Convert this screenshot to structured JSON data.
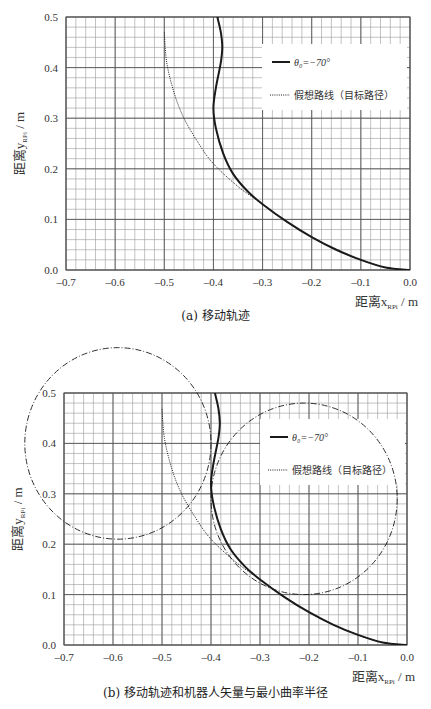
{
  "chart_data": [
    {
      "type": "line",
      "title": "(a) 移动轨迹",
      "xlabel": "距离x_RPi / m",
      "ylabel": "距离y_RPi / m",
      "xlim": [
        -0.7,
        0.0
      ],
      "ylim": [
        0.0,
        0.5
      ],
      "x_ticks": [
        "-0.7",
        "-0.6",
        "-0.5",
        "-0.4",
        "-0.3",
        "-0.2",
        "-0.1",
        "0.0"
      ],
      "y_ticks": [
        "0.0",
        "0.1",
        "0.2",
        "0.3",
        "0.4",
        "0.5"
      ],
      "grid": {
        "major": true,
        "minor": true,
        "minor_step": 0.02
      },
      "legend_position": "upper right",
      "series": [
        {
          "name": "θ0 = −70°",
          "style": "solid",
          "x": [
            0.0,
            -0.05,
            -0.1,
            -0.15,
            -0.2,
            -0.25,
            -0.3,
            -0.33,
            -0.36,
            -0.38,
            -0.395,
            -0.4,
            -0.395,
            -0.385,
            -0.382,
            -0.385,
            -0.392
          ],
          "y": [
            0.0,
            0.005,
            0.02,
            0.04,
            0.065,
            0.095,
            0.13,
            0.155,
            0.19,
            0.23,
            0.28,
            0.32,
            0.36,
            0.41,
            0.44,
            0.47,
            0.5
          ]
        },
        {
          "name": "假想路线（目标路径）",
          "style": "dotted",
          "x": [
            0.0,
            -0.05,
            -0.1,
            -0.15,
            -0.2,
            -0.25,
            -0.3,
            -0.35,
            -0.4,
            -0.43,
            -0.46,
            -0.48,
            -0.495,
            -0.5
          ],
          "y": [
            0.0,
            0.005,
            0.02,
            0.04,
            0.065,
            0.095,
            0.13,
            0.165,
            0.21,
            0.25,
            0.3,
            0.35,
            0.41,
            0.47
          ]
        }
      ]
    },
    {
      "type": "line",
      "title": "(b) 移动轨迹和机器人矢量与最小曲率半径",
      "xlabel": "距离x_RPi / m",
      "ylabel": "距离y_RPi / m",
      "xlim": [
        -0.7,
        0.0
      ],
      "ylim": [
        0.0,
        0.5
      ],
      "x_ticks": [
        "-0.7",
        "-0.6",
        "-0.5",
        "-0.4",
        "-0.3",
        "-0.2",
        "-0.1",
        "0.0"
      ],
      "y_ticks": [
        "0.0",
        "0.1",
        "0.2",
        "0.3",
        "0.4",
        "0.5"
      ],
      "grid": {
        "major": true,
        "minor": true,
        "minor_step": 0.02
      },
      "legend_position": "upper right",
      "series": [
        {
          "name": "θ0 = −70°",
          "style": "solid",
          "x": [
            0.0,
            -0.05,
            -0.1,
            -0.15,
            -0.2,
            -0.25,
            -0.3,
            -0.33,
            -0.36,
            -0.38,
            -0.395,
            -0.4,
            -0.395,
            -0.385,
            -0.382,
            -0.385,
            -0.392
          ],
          "y": [
            0.0,
            0.005,
            0.02,
            0.04,
            0.065,
            0.095,
            0.13,
            0.155,
            0.19,
            0.23,
            0.28,
            0.32,
            0.36,
            0.41,
            0.44,
            0.47,
            0.5
          ]
        },
        {
          "name": "假想路线（目标路径）",
          "style": "dotted",
          "x": [
            0.0,
            -0.05,
            -0.1,
            -0.15,
            -0.2,
            -0.25,
            -0.3,
            -0.35,
            -0.4,
            -0.43,
            -0.46,
            -0.48,
            -0.495,
            -0.5
          ],
          "y": [
            0.0,
            0.005,
            0.02,
            0.04,
            0.065,
            0.095,
            0.13,
            0.165,
            0.21,
            0.25,
            0.3,
            0.35,
            0.41,
            0.47
          ]
        },
        {
          "name": "minimum curvature radius circle (left)",
          "style": "dash-dot",
          "shape": "circle",
          "center": [
            -0.59,
            0.4
          ],
          "radius": 0.19
        },
        {
          "name": "minimum curvature radius circle (right)",
          "style": "dash-dot",
          "shape": "circle",
          "center": [
            -0.21,
            0.29
          ],
          "radius": 0.19
        }
      ]
    }
  ],
  "figure_a": {
    "caption": "(a) 移动轨迹",
    "legend": {
      "solid": "θ₀=−70°",
      "dotted": "假想路线（目标路径）"
    },
    "xlabel_main": "距离x",
    "xlabel_sub": "RPi",
    "xlabel_unit": " / m",
    "ylabel_main": "距离y",
    "ylabel_sub": "RPi",
    "ylabel_unit": " / m"
  },
  "figure_b": {
    "caption": "(b) 移动轨迹和机器人矢量与最小曲率半径",
    "legend": {
      "solid": "θ₀=−70°",
      "dotted": "假想路线（目标路径）"
    },
    "xlabel_main": "距离x",
    "xlabel_sub": "RPi",
    "xlabel_unit": " / m",
    "ylabel_main": "距离y",
    "ylabel_sub": "RPi",
    "ylabel_unit": " / m"
  },
  "colors": {
    "line": "#1a1a1a",
    "grid_major": "#555555",
    "grid_minor": "#9a9a9a",
    "text": "#333333"
  }
}
